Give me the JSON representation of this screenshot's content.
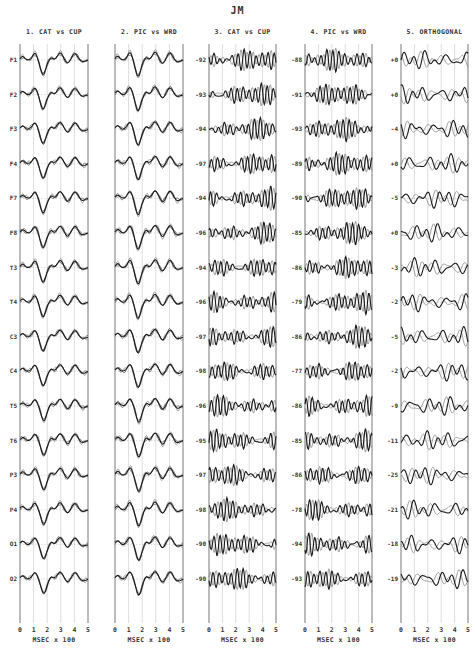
{
  "title": "JM",
  "chart_data": {
    "type": "line",
    "title": "JM",
    "xlabel": "MSEC x 100",
    "x_ticks": [
      "0",
      "1",
      "2",
      "3",
      "4",
      "5"
    ],
    "xlim": [
      0,
      5
    ],
    "channels": [
      "F1",
      "F2",
      "F3",
      "F4",
      "F7",
      "F8",
      "T3",
      "T4",
      "C3",
      "C4",
      "T5",
      "T6",
      "P3",
      "P4",
      "O1",
      "O2"
    ],
    "panels": [
      {
        "label": "1. CAT vs CUP",
        "kind": "evoked",
        "values": null
      },
      {
        "label": "2. PIC vs WRD",
        "kind": "evoked",
        "values": null
      },
      {
        "label": "3. CAT vs CUP",
        "kind": "discriminant",
        "values": [
          "-92",
          "-93",
          "-94",
          "-97",
          "-94",
          "-96",
          "-94",
          "-96",
          "-97",
          "-98",
          "-96",
          "-95",
          "-97",
          "-98",
          "-90",
          "-90"
        ]
      },
      {
        "label": "4. PIC vs WRD",
        "kind": "discriminant",
        "values": [
          "-88",
          "-91",
          "-93",
          "-89",
          "-90",
          "-85",
          "-86",
          "-79",
          "-86",
          "-77",
          "-86",
          "-85",
          "-86",
          "-78",
          "-94",
          "-93"
        ]
      },
      {
        "label": "5. ORTHOGONAL",
        "kind": "orthogonal",
        "values": [
          "+0",
          "+0",
          "-4",
          "+0",
          "-5",
          "+0",
          "-3",
          "-2",
          "-5",
          "-2",
          "-9",
          "-11",
          "-25",
          "-21",
          "-18",
          "-19"
        ]
      }
    ]
  }
}
